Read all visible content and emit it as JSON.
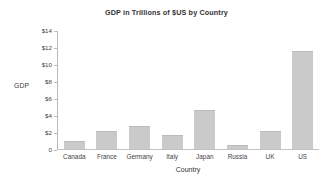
{
  "chart_data": {
    "type": "bar",
    "title": "GDP in Trillions of $US by Country",
    "xlabel": "Country",
    "ylabel": "GDP",
    "categories": [
      "Canada",
      "France",
      "Germany",
      "Italy",
      "Japan",
      "Russia",
      "UK",
      "US"
    ],
    "values": [
      1.0,
      2.1,
      2.7,
      1.7,
      4.6,
      0.5,
      2.15,
      11.6
    ],
    "ylim": [
      0,
      14
    ],
    "ytick_values": [
      0,
      2,
      4,
      6,
      8,
      10,
      12,
      14
    ],
    "ytick_labels": [
      "0",
      "$2",
      "$4",
      "$6",
      "$8",
      "$10",
      "$12",
      "$14"
    ],
    "grid": false,
    "legend": null,
    "bar_color": "#cacaca",
    "axis_color": "#bdbdbd",
    "text_color": "#3a3a3a",
    "background": "#ffffff"
  }
}
